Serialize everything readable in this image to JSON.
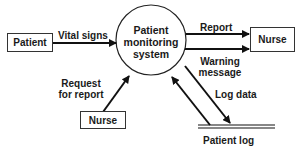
{
  "diagram": {
    "type": "data-flow-diagram",
    "process": {
      "label_lines": [
        "Patient",
        "monitoring",
        "system"
      ]
    },
    "entities": {
      "patient": "Patient",
      "nurse_right": "Nurse",
      "nurse_bottom": "Nurse"
    },
    "data_store": "Patient log",
    "flows": {
      "vital_signs": "Vital signs",
      "report": "Report",
      "warning_line1": "Warning",
      "warning_line2": "message",
      "request_line1": "Request",
      "request_line2": "for report",
      "log_data": "Log data"
    },
    "colors": {
      "line": "#111111",
      "text": "#1a1a1a",
      "background": "#ffffff"
    }
  }
}
